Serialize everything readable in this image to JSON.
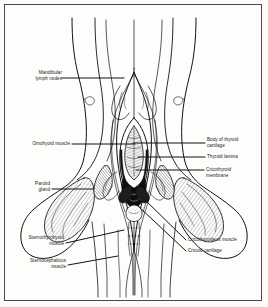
{
  "figure": {
    "kind": "anatomical-illustration",
    "background_color": "#fdfdfc",
    "frame_color": "#4a4a4a",
    "ink_color": "#111111"
  },
  "labels": {
    "mandibular_lymph_nodes": "Mandibular\nlymph nodes",
    "omohyoid_muscle": "Omohyoid muscle",
    "parotid_gland": "Parotid\ngland",
    "sternothyrohyoid_muscle": "Sternothyrohyoid\nmuscle",
    "sternocephalicus_muscle": "Sternocephalicus\nmuscle",
    "body_of_thyroid_cartilage": "Body of thyroid\ncartilage",
    "thyroid_lamina": "Thyroid lamina",
    "cricothyroid_membrane": "Cricothyroid\nmembrane",
    "cricothyroideus_muscle": "Cricothyroideus  muscle",
    "cricoid_cartilage": "Cricoid  cartilage"
  }
}
